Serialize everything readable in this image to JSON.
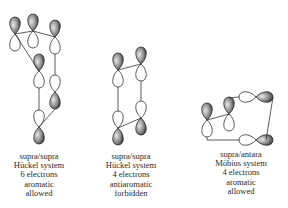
{
  "figures": [
    {
      "id": "left",
      "caption": {
        "lines": [
          "supra/supra",
          "Hückel system",
          "6 electrons",
          "aromatic",
          "allowed"
        ]
      }
    },
    {
      "id": "middle",
      "caption": {
        "lines": [
          "supra/supra",
          "Hückel system",
          "4 electrons",
          "antiaromatic",
          "forbidden"
        ]
      }
    },
    {
      "id": "right",
      "caption": {
        "lines": [
          "supra/antara",
          "Möbius system",
          "4 electrons",
          "aromatic",
          "allowed"
        ]
      }
    }
  ],
  "colors": {
    "shaded_lobe_dark": "#2b2b2b",
    "shaded_lobe_light": "#d9d9d9",
    "outline": "#333333",
    "background": "#ffffff"
  }
}
